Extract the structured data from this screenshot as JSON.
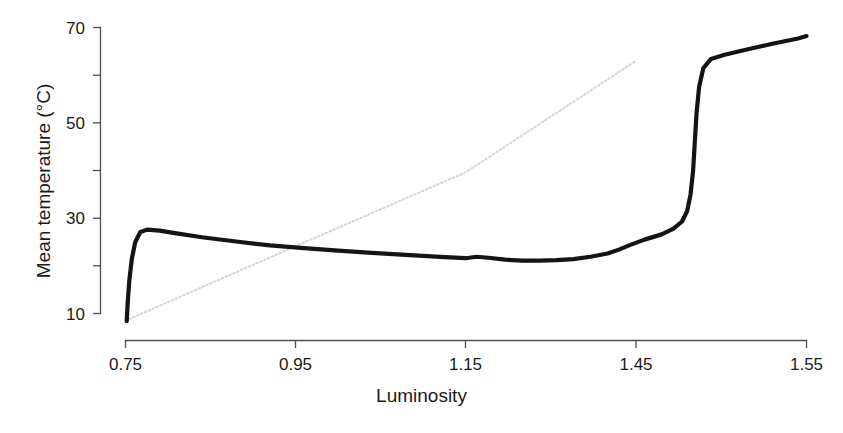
{
  "chart_data": {
    "type": "line",
    "title": "",
    "xlabel": "Luminosity",
    "ylabel": "Mean temperature (°C)",
    "xlim": [
      0.75,
      1.55
    ],
    "ylim": [
      10,
      70
    ],
    "grid": false,
    "legend": null,
    "xticks": [
      {
        "value": 0.75,
        "label": "0.75"
      },
      {
        "value": 0.95,
        "label": "0.95"
      },
      {
        "value": 1.15,
        "label": "1.15"
      },
      {
        "value": 1.45,
        "label": "1.45"
      },
      {
        "value": 1.55,
        "label": "1.55"
      }
    ],
    "xtick_labels": [
      "0.75",
      "0.95",
      "1.15",
      "1.45",
      "1.55"
    ],
    "yticks": [
      {
        "value": 10,
        "label": "10"
      },
      {
        "value": 20,
        "label": ""
      },
      {
        "value": 30,
        "label": "30"
      },
      {
        "value": 40,
        "label": ""
      },
      {
        "value": 50,
        "label": "50"
      },
      {
        "value": 60,
        "label": ""
      },
      {
        "value": 70,
        "label": "70"
      }
    ],
    "ytick_labels": [
      "10",
      "30",
      "50",
      "70"
    ],
    "series": [
      {
        "name": "reference-line",
        "style": "dotted",
        "color": "#d5d5d5",
        "x": [
          0.75,
          1.45
        ],
        "y": [
          8.5,
          63.0
        ],
        "points": [
          {
            "x": 0.75,
            "y": 8.5
          },
          {
            "x": 0.95,
            "y": 24.1
          },
          {
            "x": 1.15,
            "y": 39.6
          },
          {
            "x": 1.35,
            "y": 55.2
          },
          {
            "x": 1.45,
            "y": 63.0
          }
        ]
      },
      {
        "name": "mean-temperature",
        "style": "solid",
        "color": "#141414",
        "points": [
          {
            "x": 0.7515,
            "y": 8.4
          },
          {
            "x": 0.7525,
            "y": 12.0
          },
          {
            "x": 0.7545,
            "y": 17.0
          },
          {
            "x": 0.7575,
            "y": 21.5
          },
          {
            "x": 0.7615,
            "y": 25.0
          },
          {
            "x": 0.7675,
            "y": 27.1
          },
          {
            "x": 0.776,
            "y": 27.6
          },
          {
            "x": 0.79,
            "y": 27.4
          },
          {
            "x": 0.81,
            "y": 26.8
          },
          {
            "x": 0.84,
            "y": 26.0
          },
          {
            "x": 0.88,
            "y": 25.1
          },
          {
            "x": 0.92,
            "y": 24.3
          },
          {
            "x": 0.96,
            "y": 23.7
          },
          {
            "x": 1.0,
            "y": 23.2
          },
          {
            "x": 1.04,
            "y": 22.7
          },
          {
            "x": 1.08,
            "y": 22.3
          },
          {
            "x": 1.12,
            "y": 21.9
          },
          {
            "x": 1.15,
            "y": 21.6
          },
          {
            "x": 1.17,
            "y": 21.9
          },
          {
            "x": 1.19,
            "y": 21.7
          },
          {
            "x": 1.22,
            "y": 21.3
          },
          {
            "x": 1.25,
            "y": 21.1
          },
          {
            "x": 1.28,
            "y": 21.1
          },
          {
            "x": 1.31,
            "y": 21.2
          },
          {
            "x": 1.34,
            "y": 21.4
          },
          {
            "x": 1.37,
            "y": 21.9
          },
          {
            "x": 1.4,
            "y": 22.6
          },
          {
            "x": 1.42,
            "y": 23.4
          },
          {
            "x": 1.44,
            "y": 24.4
          },
          {
            "x": 1.455,
            "y": 25.5
          },
          {
            "x": 1.465,
            "y": 26.6
          },
          {
            "x": 1.472,
            "y": 27.8
          },
          {
            "x": 1.477,
            "y": 29.3
          },
          {
            "x": 1.48,
            "y": 31.5
          },
          {
            "x": 1.482,
            "y": 35.0
          },
          {
            "x": 1.4835,
            "y": 40.0
          },
          {
            "x": 1.4845,
            "y": 46.0
          },
          {
            "x": 1.4855,
            "y": 52.0
          },
          {
            "x": 1.487,
            "y": 57.5
          },
          {
            "x": 1.4895,
            "y": 61.5
          },
          {
            "x": 1.494,
            "y": 63.4
          },
          {
            "x": 1.502,
            "y": 64.3
          },
          {
            "x": 1.515,
            "y": 65.4
          },
          {
            "x": 1.53,
            "y": 66.6
          },
          {
            "x": 1.545,
            "y": 67.7
          },
          {
            "x": 1.55,
            "y": 68.2
          }
        ]
      }
    ],
    "annotations": []
  }
}
